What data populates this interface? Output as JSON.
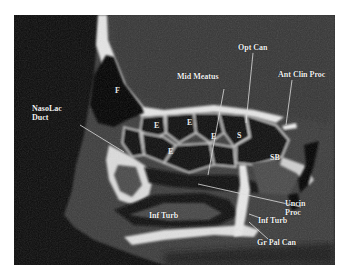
{
  "image": {
    "description": "Sagittal CT scan of paranasal sinuses with anatomical labels",
    "labels": {
      "naso_lac_duct": [
        "NasoLac",
        "Duct"
      ],
      "mid_meatus": "Mid Meatus",
      "opt_can": "Opt Can",
      "ant_clin_proc": "Ant Clin Proc",
      "uncin_proc": [
        "Uncin",
        "Proc"
      ],
      "inf_turb_left": "Inf Turb",
      "inf_turb_right": "Inf Turb",
      "gr_pal_can": "Gr Pal Can",
      "sb": "SB"
    },
    "cells": {
      "frontal": "F",
      "ethmoid_1": "E",
      "ethmoid_2": "E",
      "ethmoid_3": "E",
      "ethmoid_4": "E",
      "sphenoid": "S"
    },
    "colors": {
      "background": "#0a0a0a",
      "soft_tissue": "#3a3a3a",
      "bone": "#e6e6e6",
      "label": "#f2f2f2"
    }
  }
}
